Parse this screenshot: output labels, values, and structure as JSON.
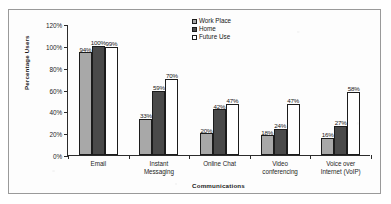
{
  "chart_data": {
    "type": "bar",
    "title": "",
    "xlabel": "Communications",
    "ylabel": "Percentage Users",
    "ylim": [
      0,
      120
    ],
    "ytick_labels": [
      "0%",
      "20%",
      "40%",
      "60%",
      "80%",
      "100%",
      "120%"
    ],
    "ytick_values": [
      0,
      20,
      40,
      60,
      80,
      100,
      120
    ],
    "grid": false,
    "legend_position": "upper-right-inside",
    "categories": [
      "Email",
      "Instant Messaging",
      "Online Chat",
      "Video conferencing",
      "Voice over Internet (VoIP)"
    ],
    "series": [
      {
        "name": "Work Place",
        "color": "#a8a8a8",
        "values": [
          94,
          33,
          20,
          18,
          16
        ],
        "labels": [
          "94%",
          "33%",
          "20%",
          "18%",
          "16%"
        ]
      },
      {
        "name": "Home",
        "color": "#4a4a4a",
        "values": [
          100,
          59,
          42,
          24,
          27
        ],
        "labels": [
          "100%",
          "59%",
          "42%",
          "24%",
          "27%"
        ]
      },
      {
        "name": "Future Use",
        "color": "#ffffff",
        "values": [
          99,
          70,
          47,
          47,
          58
        ],
        "labels": [
          "99%",
          "70%",
          "47%",
          "47%",
          "58%"
        ]
      }
    ]
  },
  "axis": {
    "y_title": "Percentage Users",
    "x_title": "Communications"
  },
  "legend": {
    "items": [
      {
        "label": "Work Place"
      },
      {
        "label": "Home"
      },
      {
        "label": "Future Use"
      }
    ]
  },
  "xcat_lines": [
    [
      "Email"
    ],
    [
      "Instant",
      "Messaging"
    ],
    [
      "Online Chat"
    ],
    [
      "Video",
      "conferencing"
    ],
    [
      "Voice over",
      "Internet (VoIP)"
    ]
  ]
}
